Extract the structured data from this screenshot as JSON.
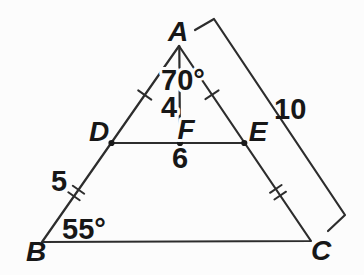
{
  "diagram": {
    "background_color": "#fcfcfc",
    "ink_color": "#2d2d2d",
    "text_color": "#171717",
    "labels": {
      "A": "A",
      "B": "B",
      "C": "C",
      "D": "D",
      "E": "E",
      "F": "F"
    },
    "measurements": {
      "angle_A": "70°",
      "segment_AF": "4",
      "segment_DE": "6",
      "segment_BD": "5",
      "angle_B": "55°",
      "side_AC": "10"
    },
    "marks": {
      "single_ticks": [
        "AD",
        "AE"
      ],
      "double_ticks": [
        "DB",
        "EC"
      ],
      "dots": [
        "D",
        "F",
        "E"
      ],
      "bracket": "AC outer dimension bracket"
    }
  }
}
